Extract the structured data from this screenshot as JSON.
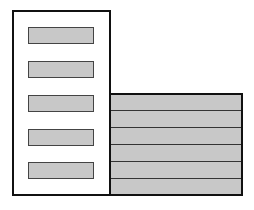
{
  "diagram": {
    "left_panel": {
      "bars": [
        {
          "top": 15
        },
        {
          "top": 49
        },
        {
          "top": 83
        },
        {
          "top": 117
        },
        {
          "top": 150
        }
      ],
      "bar_color": "#c8c8c8"
    },
    "right_panel": {
      "rows": 6,
      "fill_color": "#c8c8c8",
      "line_positions": [
        15,
        32,
        49,
        66,
        83
      ]
    }
  }
}
